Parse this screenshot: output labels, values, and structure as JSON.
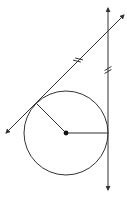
{
  "diagram": {
    "type": "geometry",
    "stroke_color": "#333333",
    "circle": {
      "cx": 66,
      "cy": 133,
      "r": 42
    },
    "center_point": {
      "x": 66,
      "y": 133
    },
    "external_point": {
      "x": 108,
      "y": 31
    },
    "tangent_points": [
      {
        "name": "upper-left",
        "x": 36.3,
        "y": 103.3
      },
      {
        "name": "right",
        "x": 108,
        "y": 133
      }
    ],
    "lines": [
      {
        "name": "diagonal-tangent-line",
        "x1": 6,
        "y1": 133,
        "x2": 124,
        "y2": 15,
        "arrows": "both"
      },
      {
        "name": "vertical-tangent-line",
        "x1": 108,
        "y1": 8,
        "x2": 108,
        "y2": 190,
        "arrows": "both"
      }
    ],
    "radii": [
      {
        "name": "radius-to-upper-left",
        "x1": 66,
        "y1": 133,
        "x2": 36.3,
        "y2": 103.3
      },
      {
        "name": "radius-to-right",
        "x1": 66,
        "y1": 133,
        "x2": 108,
        "y2": 133
      }
    ],
    "tick_marks": [
      {
        "segment": "diagonal",
        "count": 2,
        "x": 78,
        "y": 60
      },
      {
        "segment": "vertical",
        "count": 2,
        "x": 108,
        "y": 70
      }
    ]
  }
}
